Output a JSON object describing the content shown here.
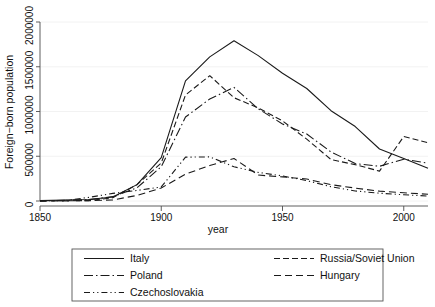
{
  "chart_data": {
    "type": "line",
    "title": "",
    "xlabel": "year",
    "ylabel": "Foreign−born population",
    "xlim": [
      1850,
      2010
    ],
    "ylim": [
      0,
      2000000
    ],
    "xticks": [
      1850,
      1900,
      1950,
      2000
    ],
    "xtick_labels": [
      "1850",
      "1900",
      "1950",
      "2000"
    ],
    "yticks": [
      0,
      500000,
      1000000,
      1500000,
      2000000
    ],
    "ytick_labels": [
      "0",
      "500000",
      "1000000",
      "1500000",
      "2000000"
    ],
    "grid": true,
    "legend_position": "below",
    "series": [
      {
        "name": "Italy",
        "dash": "solid",
        "x": [
          1850,
          1860,
          1870,
          1880,
          1890,
          1900,
          1910,
          1920,
          1930,
          1940,
          1950,
          1960,
          1970,
          1980,
          1990,
          2000,
          2010
        ],
        "values": [
          4000,
          12000,
          17000,
          44000,
          183000,
          484000,
          1343000,
          1610000,
          1790000,
          1624000,
          1427000,
          1257000,
          1009000,
          832000,
          581000,
          474000,
          365000
        ]
      },
      {
        "name": "Russia/Soviet Union",
        "dash": "dashed",
        "x": [
          1850,
          1860,
          1870,
          1880,
          1890,
          1900,
          1910,
          1920,
          1930,
          1940,
          1950,
          1960,
          1970,
          1980,
          1990,
          2000,
          2010
        ],
        "values": [
          1400,
          3000,
          4600,
          35700,
          182600,
          424000,
          1184000,
          1400000,
          1154000,
          1040000,
          895000,
          691000,
          463000,
          406000,
          334000,
          720000,
          650000
        ]
      },
      {
        "name": "Poland",
        "dash": "dashdot",
        "x": [
          1850,
          1860,
          1870,
          1880,
          1890,
          1900,
          1910,
          1920,
          1930,
          1940,
          1950,
          1960,
          1970,
          1980,
          1990,
          2000,
          2010
        ],
        "values": [
          1000,
          7300,
          14400,
          48600,
          147400,
          383000,
          938000,
          1140000,
          1269000,
          1030000,
          861000,
          748000,
          548000,
          418000,
          388000,
          467000,
          423000
        ]
      },
      {
        "name": "Hungary",
        "dash": "longdash",
        "x": [
          1850,
          1860,
          1870,
          1880,
          1890,
          1900,
          1910,
          1920,
          1930,
          1940,
          1950,
          1960,
          1970,
          1980,
          1990,
          2000,
          2010
        ],
        "values": [
          800,
          1200,
          3700,
          11500,
          62400,
          145700,
          300000,
          397000,
          475000,
          290000,
          269000,
          245000,
          183000,
          144000,
          110000,
          92000,
          76000
        ]
      },
      {
        "name": "Czechoslovakia",
        "dash": "dashdotdot",
        "x": [
          1850,
          1860,
          1870,
          1880,
          1890,
          1900,
          1910,
          1920,
          1930,
          1940,
          1950,
          1960,
          1970,
          1980,
          1990,
          2000,
          2010
        ],
        "values": [
          1500,
          4000,
          40000,
          85000,
          118000,
          157000,
          490000,
          493000,
          382000,
          320000,
          280000,
          228000,
          160000,
          112000,
          87000,
          70000,
          55000
        ]
      }
    ]
  },
  "legend": {
    "entries": [
      {
        "label": "Italy",
        "dash": "solid"
      },
      {
        "label": "Russia/Soviet Union",
        "dash": "dashed"
      },
      {
        "label": "Poland",
        "dash": "dashdot"
      },
      {
        "label": "Hungary",
        "dash": "longdash"
      },
      {
        "label": "Czechoslovakia",
        "dash": "dashdotdot"
      }
    ]
  }
}
